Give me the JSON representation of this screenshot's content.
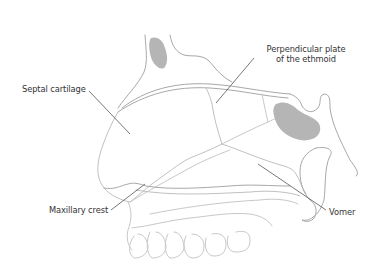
{
  "figure": {
    "colors": {
      "outline": "#a8a8a8",
      "outline_light": "#c8c8c8",
      "sinus_fill": "#b5b5b5",
      "leader_line": "#555555",
      "label_text": "#333333",
      "background": "#ffffff"
    }
  },
  "labels": {
    "septal_cartilage": "Septal cartilage",
    "perpendicular_plate_line1": "Perpendicular plate",
    "perpendicular_plate_line2": "of the ethmoid",
    "maxillary_crest": "Maxillary crest",
    "vomer": "Vomer"
  }
}
